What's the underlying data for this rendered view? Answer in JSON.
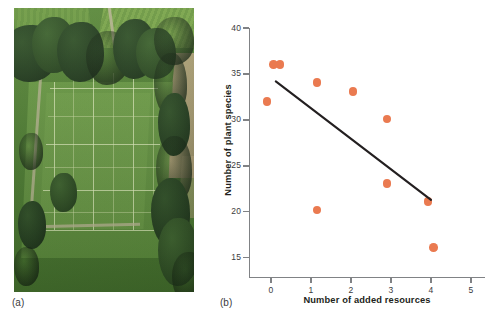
{
  "figure": {
    "panels": [
      {
        "id": "a",
        "caption": "(a)",
        "kind": "photograph",
        "description": "Aerial photograph of a grassland field experiment showing a rectangular grid of experimental plots in a mown meadow surrounded by trees"
      },
      {
        "id": "b",
        "caption": "(b)",
        "kind": "chart"
      }
    ]
  },
  "chart_data": {
    "type": "scatter",
    "title": "",
    "xlabel": "Number of added resources",
    "ylabel": "Number of plant species",
    "xlim": [
      -0.55,
      5.35
    ],
    "ylim": [
      12.9,
      40.0
    ],
    "xticks": [
      0,
      1,
      2,
      3,
      4,
      5
    ],
    "yticks": [
      15,
      20,
      25,
      30,
      35,
      40
    ],
    "xtick_labels": [
      "0",
      "1",
      "2",
      "3",
      "4",
      "5"
    ],
    "ytick_labels": [
      "15",
      "20",
      "25",
      "30",
      "35",
      "40"
    ],
    "grid": false,
    "legend": false,
    "point_color": "#ea7a50",
    "axis_color": "#808285",
    "trendline_color": "#231f20",
    "points": [
      {
        "x": -0.1,
        "y": 32.0
      },
      {
        "x": 0.06,
        "y": 36.0
      },
      {
        "x": 0.22,
        "y": 36.0
      },
      {
        "x": 1.15,
        "y": 34.1
      },
      {
        "x": 1.15,
        "y": 20.2
      },
      {
        "x": 2.05,
        "y": 33.1
      },
      {
        "x": 2.9,
        "y": 30.1
      },
      {
        "x": 2.9,
        "y": 23.1
      },
      {
        "x": 3.92,
        "y": 21.1
      },
      {
        "x": 4.06,
        "y": 16.1
      }
    ],
    "trendline": {
      "x1": 0.12,
      "y1": 34.2,
      "x2": 4.0,
      "y2": 21.3
    }
  }
}
